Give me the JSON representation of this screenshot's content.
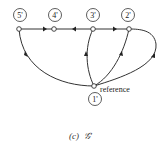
{
  "diagram": {
    "nodes": [
      {
        "id": "5p",
        "label": "5'"
      },
      {
        "id": "4p",
        "label": "4'"
      },
      {
        "id": "3p",
        "label": "3'"
      },
      {
        "id": "2p",
        "label": "2'"
      },
      {
        "id": "1p",
        "label": "1'"
      }
    ],
    "reference_label": "reference",
    "edges": [
      {
        "from": "5'",
        "to": "4'"
      },
      {
        "from": "3'",
        "to": "4'"
      },
      {
        "from": "3'",
        "to": "2'"
      },
      {
        "from": "1'",
        "to": "5'"
      },
      {
        "from": "1'",
        "to": "3'"
      },
      {
        "from": "1'",
        "to": "2'"
      },
      {
        "from": "1'",
        "to": "2'",
        "style": "outer-curve"
      }
    ],
    "caption_prefix": "(c)",
    "caption_symbol": "𝒢'"
  }
}
